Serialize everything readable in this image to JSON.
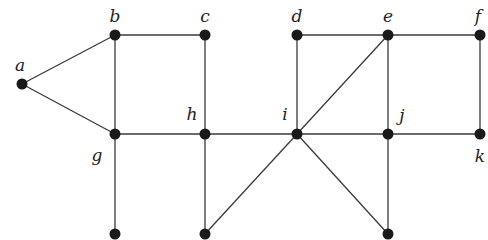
{
  "diagram": {
    "type": "undirected-graph",
    "nodes": [
      {
        "id": "a",
        "label": "a",
        "x": 22,
        "y": 84,
        "lx": 20,
        "ly": 71,
        "anchor": "middle"
      },
      {
        "id": "b",
        "label": "b",
        "x": 115,
        "y": 35,
        "lx": 115,
        "ly": 22,
        "anchor": "middle"
      },
      {
        "id": "c",
        "label": "c",
        "x": 205,
        "y": 35,
        "lx": 205,
        "ly": 22,
        "anchor": "middle"
      },
      {
        "id": "d",
        "label": "d",
        "x": 297,
        "y": 35,
        "lx": 297,
        "ly": 22,
        "anchor": "middle"
      },
      {
        "id": "e",
        "label": "e",
        "x": 388,
        "y": 35,
        "lx": 388,
        "ly": 22,
        "anchor": "middle"
      },
      {
        "id": "f",
        "label": "f",
        "x": 480,
        "y": 35,
        "lx": 478,
        "ly": 22,
        "anchor": "middle"
      },
      {
        "id": "g",
        "label": "g",
        "x": 115,
        "y": 134,
        "lx": 97,
        "ly": 161,
        "anchor": "middle"
      },
      {
        "id": "h",
        "label": "h",
        "x": 205,
        "y": 134,
        "lx": 192,
        "ly": 120,
        "anchor": "middle"
      },
      {
        "id": "i",
        "label": "i",
        "x": 297,
        "y": 134,
        "lx": 285,
        "ly": 120,
        "anchor": "middle"
      },
      {
        "id": "j",
        "label": "j",
        "x": 388,
        "y": 134,
        "lx": 402,
        "ly": 121,
        "anchor": "middle"
      },
      {
        "id": "k",
        "label": "k",
        "x": 480,
        "y": 134,
        "lx": 480,
        "ly": 162,
        "anchor": "middle"
      },
      {
        "id": "p",
        "label": "",
        "x": 115,
        "y": 234
      },
      {
        "id": "q",
        "label": "",
        "x": 205,
        "y": 234
      },
      {
        "id": "r",
        "label": "",
        "x": 388,
        "y": 234
      }
    ],
    "edges": [
      [
        "a",
        "b"
      ],
      [
        "a",
        "g"
      ],
      [
        "b",
        "c"
      ],
      [
        "b",
        "g"
      ],
      [
        "c",
        "h"
      ],
      [
        "g",
        "h"
      ],
      [
        "h",
        "i"
      ],
      [
        "i",
        "j"
      ],
      [
        "j",
        "k"
      ],
      [
        "g",
        "p"
      ],
      [
        "h",
        "q"
      ],
      [
        "i",
        "q"
      ],
      [
        "d",
        "e"
      ],
      [
        "e",
        "f"
      ],
      [
        "d",
        "i"
      ],
      [
        "e",
        "i"
      ],
      [
        "e",
        "j"
      ],
      [
        "f",
        "k"
      ],
      [
        "i",
        "r"
      ],
      [
        "j",
        "r"
      ]
    ]
  }
}
